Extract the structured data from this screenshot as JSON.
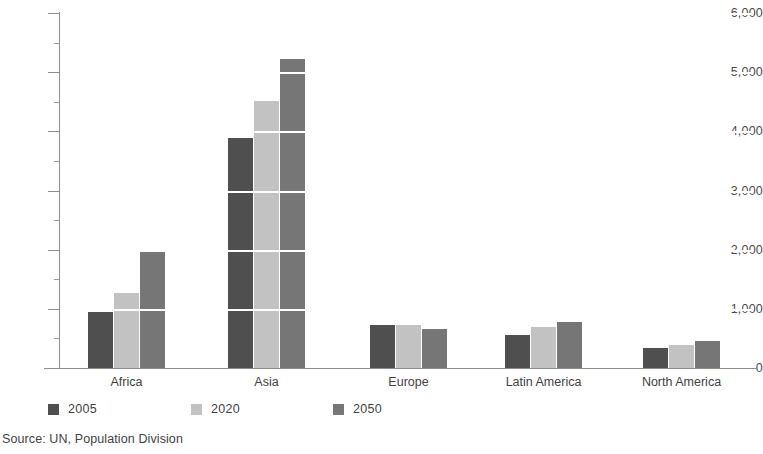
{
  "chart_data": {
    "type": "bar",
    "title": "",
    "subtitle": "",
    "xlabel": "",
    "ylabel": "",
    "categories": [
      "Africa",
      "Asia",
      "Europe",
      "Latin America",
      "North America"
    ],
    "series": [
      {
        "name": "2005",
        "color": "#4f4f4f",
        "values": [
          950,
          3880,
          730,
          560,
          330
        ]
      },
      {
        "name": "2020",
        "color": "#c2c2c2",
        "values": [
          1260,
          4520,
          720,
          690,
          390
        ]
      },
      {
        "name": "2050",
        "color": "#767676",
        "values": [
          1980,
          5220,
          665,
          780,
          450
        ]
      }
    ],
    "ylim": [
      0,
      6000
    ],
    "y_ticks": [
      0,
      1000,
      2000,
      3000,
      4000,
      5000,
      6000
    ],
    "y_tick_labels": [
      "0",
      "1,000",
      "2,000",
      "3,000",
      "4,000",
      "5,000",
      "6,000"
    ],
    "y_minor_tick_step": 500,
    "grid": "horizontal-white-over-bars",
    "legend_position": "bottom-left",
    "source": "Source: UN, Population Division"
  },
  "legend": {
    "items": [
      {
        "label": "2005"
      },
      {
        "label": "2020"
      },
      {
        "label": "2050"
      }
    ]
  },
  "footer": {
    "source": "Source: UN, Population Division"
  }
}
